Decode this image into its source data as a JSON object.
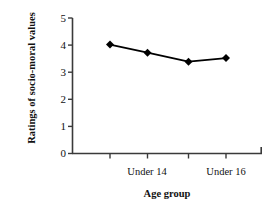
{
  "chart_data": {
    "type": "line",
    "title": "",
    "xlabel": "Age group",
    "ylabel": "Ratings of socio-moral values",
    "categories": [
      "",
      "Under 14",
      "",
      "Under 16"
    ],
    "x_tick_labels": [
      "",
      "Under 14",
      "",
      "Under 16"
    ],
    "y_tick_labels": [
      "0",
      "1",
      "2",
      "3",
      "4",
      "5"
    ],
    "values": [
      4.02,
      3.72,
      3.39,
      3.52
    ],
    "ylim": [
      0,
      5
    ],
    "y_major_step": 1,
    "grid": false,
    "legend": null,
    "series": [
      {
        "name": "Ratings of socio-moral values",
        "values": [
          4.02,
          3.72,
          3.39,
          3.52
        ],
        "marker": "diamond",
        "color": "#000000"
      }
    ],
    "line_color": "#000000",
    "marker_color": "#000000",
    "axis_color": "#3a3a3a",
    "background": "#ffffff"
  },
  "axis": {
    "y_ticks": [
      {
        "label": "5",
        "value": 5
      },
      {
        "label": "4",
        "value": 4
      },
      {
        "label": "3",
        "value": 3
      },
      {
        "label": "2",
        "value": 2
      },
      {
        "label": "1",
        "value": 1
      },
      {
        "label": "0",
        "value": 0
      }
    ],
    "x_ticks": [
      {
        "label": "",
        "index": 0
      },
      {
        "label": "Under 14",
        "index": 1
      },
      {
        "label": "",
        "index": 2
      },
      {
        "label": "Under 16",
        "index": 3
      }
    ]
  }
}
